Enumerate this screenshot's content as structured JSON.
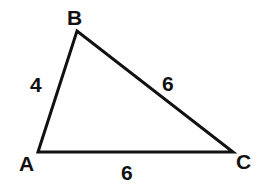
{
  "diagram": {
    "type": "triangle",
    "vertices": {
      "A": {
        "label": "A",
        "x": 38,
        "y": 152
      },
      "B": {
        "label": "B",
        "x": 77,
        "y": 31
      },
      "C": {
        "label": "C",
        "x": 233,
        "y": 152
      }
    },
    "sides": {
      "AB": {
        "label": "4"
      },
      "BC": {
        "label": "6"
      },
      "AC": {
        "label": "6"
      }
    },
    "colors": {
      "stroke": "#111111",
      "background": "#ffffff"
    }
  }
}
